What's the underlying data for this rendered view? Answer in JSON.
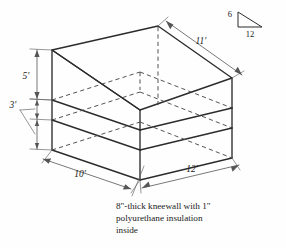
{
  "figure": {
    "background_color": "#fefefe",
    "line_color": "#2b2b2b",
    "hidden_line_color": "#4a4a4a",
    "dimension_line_color": "#555555"
  },
  "dimensions": {
    "wall_height": "5'",
    "kneewall_height": "3'",
    "depth": "10'",
    "width": "12'",
    "roof_slope_length": "11'"
  },
  "pitch": {
    "rise": "6",
    "run": "12"
  },
  "caption": {
    "line1": "8\"-thick kneewall with 1\"",
    "line2": "polyurethane insulation",
    "line3": "inside"
  }
}
